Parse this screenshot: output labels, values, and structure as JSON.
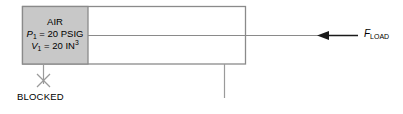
{
  "diagram": {
    "colors": {
      "line": "#808080",
      "gas_fill": "#c8c8c8",
      "text": "#000000",
      "arrow": "#1a1a1a",
      "background": "#ffffff"
    },
    "cylinder": {
      "name": "cylinder-body",
      "outline_color": "#808080"
    },
    "gas_chamber": {
      "name": "air-chamber",
      "fill": "#c8c8c8",
      "labels": {
        "medium": "AIR",
        "pressure_symbol": "P",
        "pressure_subscript": "1",
        "pressure_value": "= 20 PSIG",
        "volume_symbol": "V",
        "volume_subscript": "1",
        "volume_value": "= 20 IN",
        "volume_exponent": "3"
      }
    },
    "port": {
      "name": "blocked-port",
      "label": "BLOCKED",
      "marker": "x-cross"
    },
    "force": {
      "name": "load-force",
      "symbol": "F",
      "subscript": "LOAD",
      "direction": "left"
    },
    "piston": {
      "name": "piston-rod",
      "orientation": "horizontal"
    },
    "support": {
      "name": "support-line",
      "orientation": "vertical"
    }
  }
}
